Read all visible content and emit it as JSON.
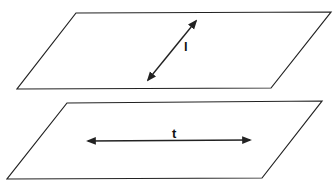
{
  "diagram": {
    "planes": [
      {
        "id": "upper-plane",
        "points": [
          [
            76,
            13
          ],
          [
            331,
            12
          ],
          [
            271,
            88
          ],
          [
            17,
            89
          ]
        ]
      },
      {
        "id": "lower-plane",
        "points": [
          [
            67,
            103
          ],
          [
            322,
            101
          ],
          [
            262,
            178
          ],
          [
            7,
            179
          ]
        ]
      }
    ],
    "lines": [
      {
        "label": "l",
        "from": [
          148,
          80
        ],
        "to": [
          196,
          21
        ],
        "label_pos": [
          184,
          40
        ]
      },
      {
        "label": "t",
        "from": [
          88,
          141
        ],
        "to": [
          250,
          140
        ],
        "label_pos": [
          172,
          127
        ]
      }
    ],
    "stroke_color": "#222222"
  }
}
